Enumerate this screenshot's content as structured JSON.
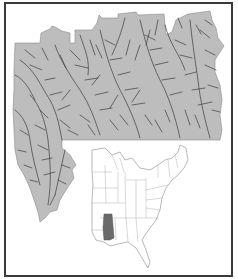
{
  "figure": {
    "type": "map",
    "colors": {
      "background": "#ffffff",
      "border": "#3a3a3a",
      "region_fill": "#bdbdbd",
      "stream_lines": "#3c3c3c",
      "inset_state_outline": "#9a9a9a",
      "inset_highlight": "#6a6a6a"
    }
  },
  "main_map": {
    "layer": "stream network",
    "fill": "region",
    "labels": []
  },
  "inset_map": {
    "extent": "Eastern United States",
    "highlighted_area": "study region (lower Mississippi basin)",
    "labels": []
  }
}
